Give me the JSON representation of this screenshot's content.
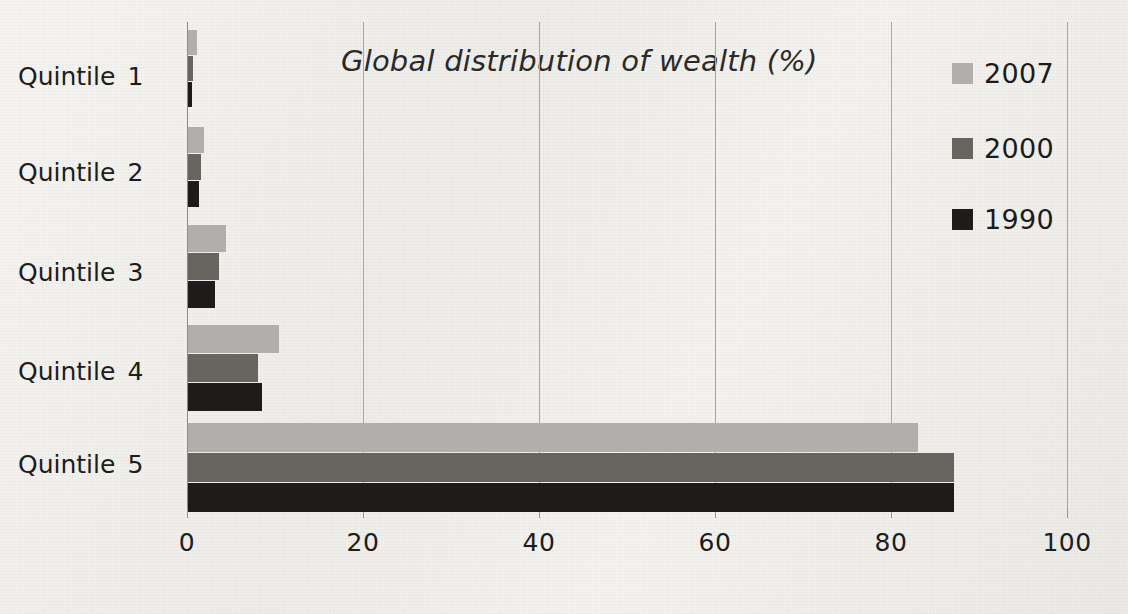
{
  "chart_data": {
    "type": "bar",
    "orientation": "horizontal",
    "title": "Global distribution of wealth (%)",
    "xlabel": "",
    "ylabel": "",
    "categories": [
      "Quintile  1",
      "Quintile  2",
      "Quintile  3",
      "Quintile  4",
      "Quintile  5"
    ],
    "category_words": [
      "Quintile",
      "Quintile",
      "Quintile",
      "Quintile",
      "Quintile"
    ],
    "category_numbers": [
      "1",
      "2",
      "3",
      "4",
      "5"
    ],
    "series": [
      {
        "name": "2007",
        "color": "#b0afac",
        "values": [
          1.0,
          1.8,
          4.3,
          10.3,
          83.0
        ]
      },
      {
        "name": "2000",
        "color": "#67655f",
        "values": [
          0.6,
          1.5,
          3.5,
          7.9,
          87.0
        ]
      },
      {
        "name": "1990",
        "color": "#1d1c1a",
        "values": [
          0.5,
          1.3,
          3.1,
          8.4,
          87.0
        ]
      }
    ],
    "xlim": [
      0,
      100
    ],
    "xticks": [
      0,
      20,
      40,
      60,
      80,
      100
    ],
    "xtick_labels": [
      "0",
      "20",
      "40",
      "60",
      "80",
      "100"
    ],
    "grid": "vertical",
    "legend_position": "top-right",
    "legend_order": [
      "2007",
      "2000",
      "1990"
    ],
    "background_color": "#f2f1ee",
    "gridline_color": "#a9a7a3",
    "text_color": "#1d1d1b"
  },
  "legend": {
    "entries": [
      {
        "label": "2007",
        "color": "#b0afac"
      },
      {
        "label": "2000",
        "color": "#67655f"
      },
      {
        "label": "1990",
        "color": "#1d1c1a"
      }
    ]
  },
  "axis": {
    "x_tick_labels": [
      "0",
      "20",
      "40",
      "60",
      "80",
      "100"
    ]
  }
}
